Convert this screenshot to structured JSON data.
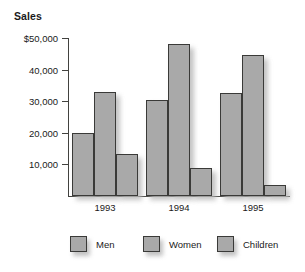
{
  "chart_data": {
    "type": "bar",
    "title": "Sales",
    "xlabel": "",
    "ylabel": "",
    "categories": [
      "1993",
      "1994",
      "1995"
    ],
    "series": [
      {
        "name": "Men",
        "values": [
          20000,
          30500,
          32500
        ]
      },
      {
        "name": "Women",
        "values": [
          33000,
          48000,
          44500
        ]
      },
      {
        "name": "Children",
        "values": [
          13200,
          8800,
          3500
        ]
      }
    ],
    "ylim": [
      0,
      50000
    ],
    "yticks": [
      10000,
      20000,
      30000,
      40000,
      50000
    ],
    "ytick_labels": [
      "10,000",
      "20,000",
      "30,000",
      "40,000",
      "$50,000"
    ],
    "grid": false,
    "legend_position": "bottom",
    "bar_fill_color": "#a9a9a9",
    "bar_border_color": "#3a3a38"
  },
  "legend": {
    "items": [
      {
        "label": "Men"
      },
      {
        "label": "Women"
      },
      {
        "label": "Children"
      }
    ]
  }
}
